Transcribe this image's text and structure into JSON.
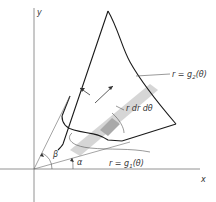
{
  "diagram": {
    "axes": {
      "x_label": "x",
      "y_label": "y"
    },
    "curves": {
      "outer": {
        "label": "r = g",
        "sub": "2",
        "arg": "(θ)"
      },
      "inner": {
        "label": "r = g",
        "sub": "1",
        "arg": "(θ)"
      }
    },
    "element_label": "r dr dθ",
    "angles": {
      "alpha": "α",
      "beta": "β"
    },
    "colors": {
      "line": "#1a1a1a",
      "thin": "#555555",
      "strip": "#d4d4d4",
      "element": "#a8a8a8"
    }
  }
}
